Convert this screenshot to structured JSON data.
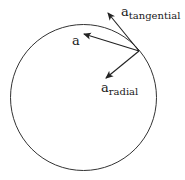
{
  "diagram": {
    "circle": {
      "cx": 83.5,
      "cy": 97.5,
      "r": 73,
      "stroke": "#333333"
    },
    "origin_point": {
      "x": 139,
      "y": 51
    },
    "vectors": [
      {
        "id": "a",
        "base": "a",
        "subscript": "",
        "tip": {
          "x": 84,
          "y": 34
        },
        "label_pos": {
          "x": 72,
          "y": 45
        }
      },
      {
        "id": "a_tangential",
        "base": "a",
        "subscript": "tangential",
        "tip": {
          "x": 108,
          "y": 13
        },
        "label_pos": {
          "x": 121,
          "y": 16
        }
      },
      {
        "id": "a_radial",
        "base": "a",
        "subscript": "radial",
        "tip": {
          "x": 106,
          "y": 78
        },
        "label_pos": {
          "x": 101,
          "y": 92
        }
      }
    ],
    "labels": {
      "a": "a",
      "a_tangential_base": "a",
      "a_tangential_sub": "tangential",
      "a_radial_base": "a",
      "a_radial_sub": "radial"
    },
    "colors": {
      "stroke": "#222222",
      "text": "#1a1a1a",
      "background": "#ffffff"
    }
  }
}
